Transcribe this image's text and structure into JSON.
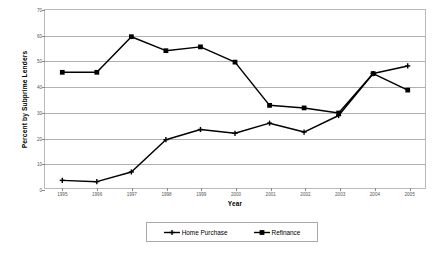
{
  "chart_data": {
    "type": "line",
    "title": "",
    "xlabel": "Year",
    "ylabel": "Percent by Subprime Lenders",
    "categories": [
      "1995",
      "1996",
      "1997",
      "1998",
      "1999",
      "2000",
      "2001",
      "2002",
      "2003",
      "2004",
      "2005"
    ],
    "ylim": [
      0,
      70
    ],
    "yticks": [
      0,
      10,
      20,
      30,
      40,
      50,
      60,
      70
    ],
    "ytick_labels": [
      "0",
      "10",
      "20",
      "30",
      "40",
      "50",
      "60",
      "70"
    ],
    "grid": true,
    "legend_position": "bottom",
    "series": [
      {
        "name": "Home Purchase",
        "marker": "plus",
        "color": "#000000",
        "values": [
          3.0,
          2.5,
          6.3,
          19.0,
          23.0,
          21.5,
          25.5,
          22.0,
          28.5,
          45.0,
          48.0
        ]
      },
      {
        "name": "Refinance",
        "marker": "square",
        "color": "#000000",
        "values": [
          45.5,
          45.5,
          59.5,
          54.0,
          55.5,
          49.5,
          32.5,
          31.5,
          29.5,
          45.0,
          38.5
        ]
      }
    ]
  }
}
